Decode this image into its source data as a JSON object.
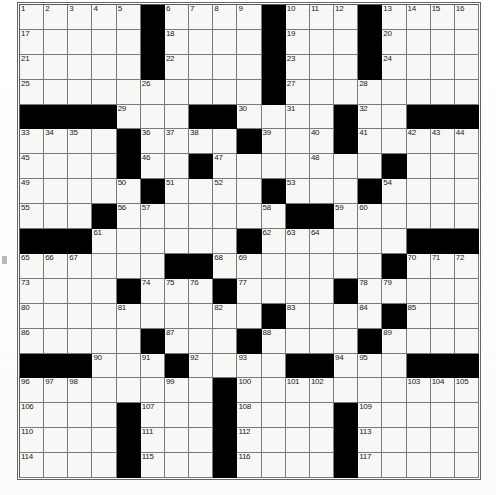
{
  "puzzle": {
    "type": "crossword-grid",
    "columns": 19,
    "rows": 19,
    "cell_px": 24.2,
    "colors": {
      "block": "#000000",
      "cell": "#f7f7f5",
      "grid_line": "#7a7a7a",
      "number_text": "#1a1a1a"
    },
    "total_clue_numbers": 117,
    "blocks": [
      [
        0,
        5
      ],
      [
        0,
        10
      ],
      [
        0,
        14
      ],
      [
        1,
        5
      ],
      [
        1,
        10
      ],
      [
        1,
        14
      ],
      [
        2,
        5
      ],
      [
        2,
        10
      ],
      [
        2,
        14
      ],
      [
        3,
        10
      ],
      [
        4,
        0
      ],
      [
        4,
        1
      ],
      [
        4,
        2
      ],
      [
        4,
        3
      ],
      [
        4,
        7
      ],
      [
        4,
        8
      ],
      [
        4,
        13
      ],
      [
        4,
        16
      ],
      [
        4,
        17
      ],
      [
        4,
        18
      ],
      [
        5,
        4
      ],
      [
        5,
        9
      ],
      [
        5,
        13
      ],
      [
        6,
        4
      ],
      [
        6,
        7
      ],
      [
        6,
        15
      ],
      [
        7,
        5
      ],
      [
        7,
        10
      ],
      [
        7,
        14
      ],
      [
        8,
        3
      ],
      [
        8,
        11
      ],
      [
        8,
        12
      ],
      [
        9,
        0
      ],
      [
        9,
        1
      ],
      [
        9,
        2
      ],
      [
        9,
        9
      ],
      [
        9,
        16
      ],
      [
        9,
        17
      ],
      [
        9,
        18
      ],
      [
        10,
        6
      ],
      [
        10,
        7
      ],
      [
        10,
        15
      ],
      [
        11,
        4
      ],
      [
        11,
        8
      ],
      [
        11,
        13
      ],
      [
        12,
        10
      ],
      [
        12,
        15
      ],
      [
        13,
        5
      ],
      [
        13,
        9
      ],
      [
        13,
        14
      ],
      [
        14,
        0
      ],
      [
        14,
        1
      ],
      [
        14,
        2
      ],
      [
        14,
        6
      ],
      [
        14,
        11
      ],
      [
        14,
        12
      ],
      [
        14,
        16
      ],
      [
        14,
        17
      ],
      [
        14,
        18
      ],
      [
        15,
        8
      ],
      [
        16,
        4
      ],
      [
        16,
        8
      ],
      [
        16,
        13
      ],
      [
        17,
        4
      ],
      [
        17,
        8
      ],
      [
        17,
        13
      ],
      [
        18,
        4
      ],
      [
        18,
        8
      ],
      [
        18,
        13
      ]
    ],
    "numbers": [
      {
        "r": 0,
        "c": 0,
        "n": "1"
      },
      {
        "r": 0,
        "c": 1,
        "n": "2"
      },
      {
        "r": 0,
        "c": 2,
        "n": "3"
      },
      {
        "r": 0,
        "c": 3,
        "n": "4"
      },
      {
        "r": 0,
        "c": 4,
        "n": "5"
      },
      {
        "r": 0,
        "c": 6,
        "n": "6"
      },
      {
        "r": 0,
        "c": 7,
        "n": "7"
      },
      {
        "r": 0,
        "c": 8,
        "n": "8"
      },
      {
        "r": 0,
        "c": 9,
        "n": "9"
      },
      {
        "r": 0,
        "c": 11,
        "n": "10"
      },
      {
        "r": 0,
        "c": 12,
        "n": "11"
      },
      {
        "r": 0,
        "c": 13,
        "n": "12"
      },
      {
        "r": 0,
        "c": 15,
        "n": "13"
      },
      {
        "r": 0,
        "c": 16,
        "n": "14"
      },
      {
        "r": 0,
        "c": 17,
        "n": "15"
      },
      {
        "r": 0,
        "c": 18,
        "n": "16"
      },
      {
        "r": 1,
        "c": 0,
        "n": "17"
      },
      {
        "r": 1,
        "c": 6,
        "n": "18"
      },
      {
        "r": 1,
        "c": 11,
        "n": "19"
      },
      {
        "r": 1,
        "c": 15,
        "n": "20"
      },
      {
        "r": 2,
        "c": 0,
        "n": "21"
      },
      {
        "r": 2,
        "c": 6,
        "n": "22"
      },
      {
        "r": 2,
        "c": 11,
        "n": "23"
      },
      {
        "r": 2,
        "c": 15,
        "n": "24"
      },
      {
        "r": 3,
        "c": 0,
        "n": "25"
      },
      {
        "r": 3,
        "c": 5,
        "n": "26"
      },
      {
        "r": 3,
        "c": 11,
        "n": "27"
      },
      {
        "r": 3,
        "c": 14,
        "n": "28"
      },
      {
        "r": 4,
        "c": 4,
        "n": "29"
      },
      {
        "r": 4,
        "c": 9,
        "n": "30"
      },
      {
        "r": 4,
        "c": 11,
        "n": "31"
      },
      {
        "r": 4,
        "c": 14,
        "n": "32"
      },
      {
        "r": 5,
        "c": 0,
        "n": "33"
      },
      {
        "r": 5,
        "c": 1,
        "n": "34"
      },
      {
        "r": 5,
        "c": 2,
        "n": "35"
      },
      {
        "r": 5,
        "c": 5,
        "n": "36"
      },
      {
        "r": 5,
        "c": 6,
        "n": "37"
      },
      {
        "r": 5,
        "c": 7,
        "n": "38"
      },
      {
        "r": 5,
        "c": 10,
        "n": "39"
      },
      {
        "r": 5,
        "c": 12,
        "n": "40"
      },
      {
        "r": 5,
        "c": 14,
        "n": "41"
      },
      {
        "r": 5,
        "c": 16,
        "n": "42"
      },
      {
        "r": 5,
        "c": 17,
        "n": "43"
      },
      {
        "r": 5,
        "c": 18,
        "n": "44"
      },
      {
        "r": 6,
        "c": 0,
        "n": "45"
      },
      {
        "r": 6,
        "c": 5,
        "n": "46"
      },
      {
        "r": 6,
        "c": 8,
        "n": "47"
      },
      {
        "r": 6,
        "c": 12,
        "n": "48"
      },
      {
        "r": 7,
        "c": 0,
        "n": "49"
      },
      {
        "r": 7,
        "c": 4,
        "n": "50"
      },
      {
        "r": 7,
        "c": 6,
        "n": "51"
      },
      {
        "r": 7,
        "c": 8,
        "n": "52"
      },
      {
        "r": 7,
        "c": 11,
        "n": "53"
      },
      {
        "r": 7,
        "c": 15,
        "n": "54"
      },
      {
        "r": 8,
        "c": 0,
        "n": "55"
      },
      {
        "r": 8,
        "c": 4,
        "n": "56"
      },
      {
        "r": 8,
        "c": 5,
        "n": "57"
      },
      {
        "r": 8,
        "c": 10,
        "n": "58"
      },
      {
        "r": 8,
        "c": 13,
        "n": "59"
      },
      {
        "r": 8,
        "c": 14,
        "n": "60"
      },
      {
        "r": 9,
        "c": 3,
        "n": "61"
      },
      {
        "r": 9,
        "c": 10,
        "n": "62"
      },
      {
        "r": 9,
        "c": 11,
        "n": "63"
      },
      {
        "r": 9,
        "c": 12,
        "n": "64"
      },
      {
        "r": 10,
        "c": 0,
        "n": "65"
      },
      {
        "r": 10,
        "c": 1,
        "n": "66"
      },
      {
        "r": 10,
        "c": 2,
        "n": "67"
      },
      {
        "r": 10,
        "c": 8,
        "n": "68"
      },
      {
        "r": 10,
        "c": 9,
        "n": "69"
      },
      {
        "r": 10,
        "c": 16,
        "n": "70"
      },
      {
        "r": 10,
        "c": 17,
        "n": "71"
      },
      {
        "r": 10,
        "c": 18,
        "n": "72"
      },
      {
        "r": 11,
        "c": 0,
        "n": "73"
      },
      {
        "r": 11,
        "c": 5,
        "n": "74"
      },
      {
        "r": 11,
        "c": 6,
        "n": "75"
      },
      {
        "r": 11,
        "c": 7,
        "n": "76"
      },
      {
        "r": 11,
        "c": 9,
        "n": "77"
      },
      {
        "r": 11,
        "c": 14,
        "n": "78"
      },
      {
        "r": 11,
        "c": 15,
        "n": "79"
      },
      {
        "r": 12,
        "c": 0,
        "n": "80"
      },
      {
        "r": 12,
        "c": 4,
        "n": "81"
      },
      {
        "r": 12,
        "c": 8,
        "n": "82"
      },
      {
        "r": 12,
        "c": 11,
        "n": "83"
      },
      {
        "r": 12,
        "c": 14,
        "n": "84"
      },
      {
        "r": 12,
        "c": 16,
        "n": "85"
      },
      {
        "r": 13,
        "c": 0,
        "n": "86"
      },
      {
        "r": 13,
        "c": 6,
        "n": "87"
      },
      {
        "r": 13,
        "c": 10,
        "n": "88"
      },
      {
        "r": 13,
        "c": 15,
        "n": "89"
      },
      {
        "r": 14,
        "c": 3,
        "n": "90"
      },
      {
        "r": 14,
        "c": 5,
        "n": "91"
      },
      {
        "r": 14,
        "c": 7,
        "n": "92"
      },
      {
        "r": 14,
        "c": 9,
        "n": "93"
      },
      {
        "r": 14,
        "c": 13,
        "n": "94"
      },
      {
        "r": 14,
        "c": 14,
        "n": "95"
      },
      {
        "r": 15,
        "c": 0,
        "n": "96"
      },
      {
        "r": 15,
        "c": 1,
        "n": "97"
      },
      {
        "r": 15,
        "c": 2,
        "n": "98"
      },
      {
        "r": 15,
        "c": 6,
        "n": "99"
      },
      {
        "r": 15,
        "c": 9,
        "n": "100"
      },
      {
        "r": 15,
        "c": 11,
        "n": "101"
      },
      {
        "r": 15,
        "c": 12,
        "n": "102"
      },
      {
        "r": 15,
        "c": 16,
        "n": "103"
      },
      {
        "r": 15,
        "c": 17,
        "n": "104"
      },
      {
        "r": 15,
        "c": 18,
        "n": "105"
      },
      {
        "r": 16,
        "c": 0,
        "n": "106"
      },
      {
        "r": 16,
        "c": 5,
        "n": "107"
      },
      {
        "r": 16,
        "c": 9,
        "n": "108"
      },
      {
        "r": 16,
        "c": 14,
        "n": "109"
      },
      {
        "r": 17,
        "c": 0,
        "n": "110"
      },
      {
        "r": 17,
        "c": 5,
        "n": "111"
      },
      {
        "r": 17,
        "c": 9,
        "n": "112"
      },
      {
        "r": 17,
        "c": 14,
        "n": "113"
      },
      {
        "r": 18,
        "c": 0,
        "n": "114"
      },
      {
        "r": 18,
        "c": 5,
        "n": "115"
      },
      {
        "r": 18,
        "c": 9,
        "n": "116"
      },
      {
        "r": 18,
        "c": 14,
        "n": "117"
      }
    ]
  }
}
